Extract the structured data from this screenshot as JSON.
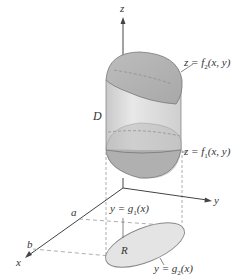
{
  "figure": {
    "axes": {
      "x": "x",
      "y": "y",
      "z": "z"
    },
    "labels": {
      "top_surface": "z = f2(x, y)",
      "bottom_surface": "z = f1(x, y)",
      "solid": "D",
      "region": "R",
      "lower_curve": "y = g1(x)",
      "upper_curve": "y = g2(x)",
      "x_lower": "a",
      "x_upper": "b"
    },
    "colors": {
      "solid_fill": "#dcdcdc",
      "cap_fill": "#b9b9b9",
      "region_fill": "#e6e6e6",
      "line": "#555555",
      "dashed": "#999999"
    }
  }
}
